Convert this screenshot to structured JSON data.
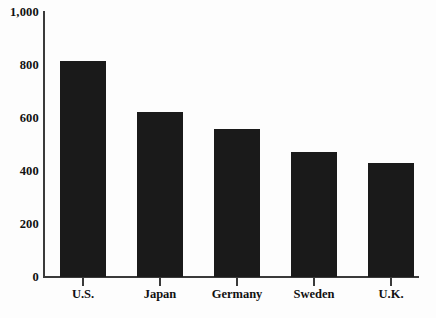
{
  "chart_data": {
    "type": "bar",
    "title": "",
    "subtitle": "",
    "xlabel": "",
    "ylabel": "",
    "categories": [
      "U.S.",
      "Japan",
      "Germany",
      "Sweden",
      "U.K."
    ],
    "values": [
      815,
      623,
      558,
      472,
      430
    ],
    "series": [
      {
        "name": "",
        "values": [
          815,
          623,
          558,
          472,
          430
        ]
      }
    ],
    "ylim": [
      0,
      1000
    ],
    "ytick_values": [
      0,
      200,
      400,
      600,
      800,
      1000
    ],
    "ytick_labels": [
      "0",
      "200",
      "400",
      "600",
      "800",
      "1,000"
    ],
    "grid": false,
    "legend": false,
    "legend_position": "none",
    "bar_color": "#1a1a1a",
    "axis_color": "#3a3a3a",
    "background_color": "#fdfdfd",
    "annotations": []
  }
}
